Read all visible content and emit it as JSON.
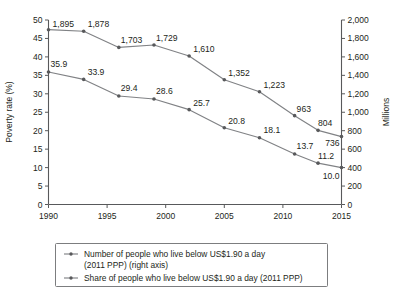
{
  "chart_data": {
    "type": "line",
    "title": "",
    "subtitle": "",
    "xlabel": "",
    "ylabel": "Poverty rate (%)",
    "y2label": "Millions",
    "x": [
      1990,
      1993,
      1996,
      1999,
      2002,
      2005,
      2008,
      2011,
      2013,
      2015
    ],
    "xlim": [
      1990,
      2015
    ],
    "xticks": [
      1990,
      1995,
      2000,
      2005,
      2010,
      2015
    ],
    "xticklabels": [
      "1990",
      "1995",
      "2000",
      "2005",
      "2010",
      "2015"
    ],
    "ylim": [
      0,
      50
    ],
    "yticks": [
      0,
      5,
      10,
      15,
      20,
      25,
      30,
      35,
      40,
      45,
      50
    ],
    "yticklabels": [
      "0",
      "5",
      "10",
      "15",
      "20",
      "25",
      "30",
      "35",
      "40",
      "45",
      "50"
    ],
    "y2lim": [
      0,
      2000
    ],
    "y2ticks": [
      0,
      200,
      400,
      600,
      800,
      1000,
      1200,
      1400,
      1600,
      1800,
      2000
    ],
    "y2ticklabels": [
      "0",
      "200",
      "400",
      "600",
      "800",
      "1,000",
      "1,200",
      "1,400",
      "1,600",
      "1,800",
      "2,000"
    ],
    "grid": false,
    "legend_position": "below-plot",
    "series": [
      {
        "name": "Number of people who live below US$1.90 a day (2011 PPP) (right axis)",
        "axis": "right",
        "values": [
          1895,
          1878,
          1703,
          1729,
          1610,
          1352,
          1223,
          963,
          804,
          736
        ],
        "labels": [
          "1,895",
          "1,878",
          "1,703",
          "1,729",
          "1,610",
          "1,352",
          "1,223",
          "963",
          "804",
          "736"
        ],
        "color": "#808285"
      },
      {
        "name": "Share of people who live below US$1.90 a day (2011 PPP)",
        "axis": "left",
        "values": [
          35.9,
          33.9,
          29.4,
          28.6,
          25.7,
          20.8,
          18.1,
          13.7,
          11.2,
          10.0
        ],
        "labels": [
          "35.9",
          "33.9",
          "29.4",
          "28.6",
          "25.7",
          "20.8",
          "18.1",
          "13.7",
          "11.2",
          "10.0"
        ],
        "color": "#808285"
      }
    ]
  },
  "legend": {
    "entries": [
      {
        "line1": "Number of people who live below US$1.90 a day",
        "line2": "(2011 PPP) (right axis)"
      },
      {
        "line1": "Share of people who live below US$1.90 a day (2011 PPP)",
        "line2": ""
      }
    ]
  },
  "colors": {
    "line": "#808285",
    "marker": "#58595b",
    "axis": "#58595b",
    "text": "#231f20",
    "legend_border": "#6d6e71",
    "background": "#ffffff"
  }
}
